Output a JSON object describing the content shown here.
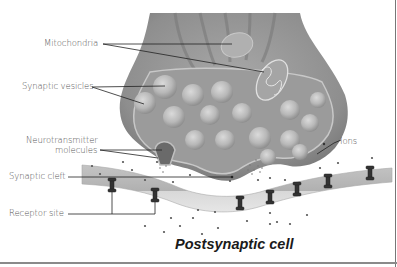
{
  "diagram": {
    "title": "Postsynaptic cell",
    "labels": {
      "mitochondria": "Mitochondria",
      "synaptic_vesicles": "Synaptic vesicles",
      "neurotransmitter_line1": "Neurotransmitter",
      "neurotransmitter_line2": "molecules",
      "synaptic_cleft": "Synaptic cleft",
      "receptor_site": "Receptor site",
      "ions": "Ions"
    },
    "colors": {
      "terminal_outer": "#8c8c8c",
      "terminal_inner": "#9a9a9a",
      "membrane": "#bdbdbd",
      "membrane_light": "#dcdcdc",
      "vesicle": "#b5b5b5",
      "receptor": "#3a3a3a",
      "leader_line": "#222222"
    }
  }
}
